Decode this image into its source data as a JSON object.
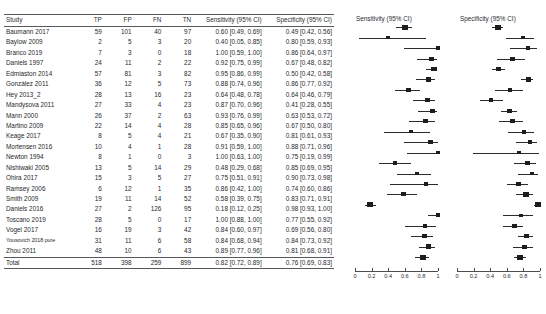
{
  "table": {
    "columns": [
      "Study",
      "TP",
      "FP",
      "FN",
      "TN",
      "Sensitivity (95% CI)",
      "Specificity (95% CI)"
    ],
    "rows": [
      {
        "study": "Baumann 2017",
        "tp": "59",
        "fp": "101",
        "fn": "40",
        "tn": "97",
        "sens": "0.60 [0.49, 0.69]",
        "spec": "0.49 [0.42, 0.56]"
      },
      {
        "study": "Baylow 2009",
        "tp": "2",
        "fp": "5",
        "fn": "3",
        "tn": "20",
        "sens": "0.40 [0.05, 0.85]",
        "spec": "0.80 [0.59, 0.93]"
      },
      {
        "study": "Branco 2019",
        "tp": "7",
        "fp": "3",
        "fn": "0",
        "tn": "18",
        "sens": "1.00 [0.59, 1.00]",
        "spec": "0.86 [0.64, 0.97]"
      },
      {
        "study": "Daniels 1997",
        "tp": "24",
        "fp": "11",
        "fn": "2",
        "tn": "22",
        "sens": "0.92 [0.75, 0.99]",
        "spec": "0.67 [0.48, 0.82]"
      },
      {
        "study": "Edmiaston 2014",
        "tp": "57",
        "fp": "81",
        "fn": "3",
        "tn": "82",
        "sens": "0.95 [0.86, 0.99]",
        "spec": "0.50 [0.42, 0.58]"
      },
      {
        "study": "González 2011",
        "tp": "36",
        "fp": "12",
        "fn": "5",
        "tn": "73",
        "sens": "0.88 [0.74, 0.96]",
        "spec": "0.86 [0.77, 0.92]"
      },
      {
        "study": "Hey 2013_2",
        "tp": "28",
        "fp": "13",
        "fn": "16",
        "tn": "23",
        "sens": "0.64 [0.48, 0.78]",
        "spec": "0.64 [0.46, 0.79]"
      },
      {
        "study": "Mandysova 2011",
        "tp": "27",
        "fp": "33",
        "fn": "4",
        "tn": "23",
        "sens": "0.87 [0.70, 0.96]",
        "spec": "0.41 [0.28, 0.55]"
      },
      {
        "study": "Mann 2000",
        "tp": "26",
        "fp": "37",
        "fn": "2",
        "tn": "63",
        "sens": "0.93 [0.76, 0.99]",
        "spec": "0.63 [0.53, 0.72]"
      },
      {
        "study": "Martino 2009",
        "tp": "22",
        "fp": "14",
        "fn": "4",
        "tn": "28",
        "sens": "0.85 [0.65, 0.96]",
        "spec": "0.67 [0.50, 0.80]"
      },
      {
        "study": "Keage 2017",
        "tp": "8",
        "fp": "5",
        "fn": "4",
        "tn": "21",
        "sens": "0.67 [0.35, 0.90]",
        "spec": "0.81 [0.61, 0.93]"
      },
      {
        "study": "Mortensen 2016",
        "tp": "10",
        "fp": "4",
        "fn": "1",
        "tn": "28",
        "sens": "0.91 [0.59, 1.00]",
        "spec": "0.88 [0.71, 0.96]"
      },
      {
        "study": "Newton 1994",
        "tp": "8",
        "fp": "1",
        "fn": "0",
        "tn": "3",
        "sens": "1.00 [0.63, 1.00]",
        "spec": "0.75 [0.19, 0.99]"
      },
      {
        "study": "Nishiwaki 2005",
        "tp": "13",
        "fp": "5",
        "fn": "14",
        "tn": "29",
        "sens": "0.48 [0.29, 0.68]",
        "spec": "0.85 [0.69, 0.95]"
      },
      {
        "study": "Ohira 2017",
        "tp": "15",
        "fp": "3",
        "fn": "5",
        "tn": "27",
        "sens": "0.75 [0.51, 0.91]",
        "spec": "0.90 [0.73, 0.98]"
      },
      {
        "study": "Ramsey 2006",
        "tp": "6",
        "fp": "12",
        "fn": "1",
        "tn": "35",
        "sens": "0.86 [0.42, 1.00]",
        "spec": "0.74 [0.60, 0.86]"
      },
      {
        "study": "Smith 2009",
        "tp": "19",
        "fp": "11",
        "fn": "14",
        "tn": "52",
        "sens": "0.58 [0.39, 0.75]",
        "spec": "0.83 [0.71, 0.91]"
      },
      {
        "study": "Daniels 2016",
        "tp": "27",
        "fp": "2",
        "fn": "126",
        "tn": "95",
        "sens": "0.18 [0.12, 0.25]",
        "spec": "0.98 [0.93, 1.00]"
      },
      {
        "study": "Toscano 2019",
        "tp": "28",
        "fp": "5",
        "fn": "0",
        "tn": "17",
        "sens": "1.00 [0.88, 1.00]",
        "spec": "0.77 [0.55, 0.92]"
      },
      {
        "study": "Vogel 2017",
        "tp": "16",
        "fp": "19",
        "fn": "3",
        "tn": "42",
        "sens": "0.84 [0.60, 0.97]",
        "spec": "0.69 [0.56, 0.80]"
      },
      {
        "study": "Yousovich 2018 pure",
        "tp": "31",
        "fp": "11",
        "fn": "6",
        "tn": "58",
        "sens": "0.84 [0.68, 0.94]",
        "spec": "0.84 [0.73, 0.92]",
        "small": true
      },
      {
        "study": "Zhou 2011",
        "tp": "48",
        "fp": "10",
        "fn": "6",
        "tn": "43",
        "sens": "0.89 [0.77, 0.96]",
        "spec": "0.81 [0.68, 0.91]"
      },
      {
        "study": "Total",
        "tp": "518",
        "fp": "398",
        "fn": "259",
        "tn": "899",
        "sens": "0.82 [0.72, 0.89]",
        "spec": "0.76 [0.69, 0.83]"
      }
    ]
  },
  "plot": {
    "sensitivity_title": "Sensitivity (95% CI)",
    "specificity_title": "Specificity (95% CI)",
    "tick_labels": [
      "0",
      "0.2",
      "0.4",
      "0.6",
      "0.8",
      "1"
    ],
    "axis_min": 0,
    "axis_max": 1,
    "marker_color": "#1d1d1d"
  },
  "chart_data": {
    "type": "scatter",
    "panels": [
      "Sensitivity (95% CI)",
      "Specificity (95% CI)"
    ],
    "xlabel": "",
    "ylabel": "Study",
    "xlim": [
      0,
      1
    ],
    "xticks": [
      0,
      0.2,
      0.4,
      0.6,
      0.8,
      1
    ],
    "grid": false,
    "legend": "none",
    "categories": [
      "Baumann 2017",
      "Baylow 2009",
      "Branco 2019",
      "Daniels 1997",
      "Edmiaston 2014",
      "González 2011",
      "Hey 2013_2",
      "Mandysova 2011",
      "Mann 2000",
      "Martino 2009",
      "Keage 2017",
      "Mortensen 2016",
      "Newton 1994",
      "Nishiwaki 2005",
      "Ohira 2017",
      "Ramsey 2006",
      "Smith 2009",
      "Daniels 2016",
      "Toscano 2019",
      "Vogel 2017",
      "Yousovich 2018 pure",
      "Zhou 2011",
      "Total"
    ],
    "series": [
      {
        "name": "Sensitivity",
        "estimates": [
          0.6,
          0.4,
          1.0,
          0.92,
          0.95,
          0.88,
          0.64,
          0.87,
          0.93,
          0.85,
          0.67,
          0.91,
          1.0,
          0.48,
          0.75,
          0.86,
          0.58,
          0.18,
          1.0,
          0.84,
          0.84,
          0.89,
          0.82
        ],
        "ci_low": [
          0.49,
          0.05,
          0.59,
          0.75,
          0.86,
          0.74,
          0.48,
          0.7,
          0.76,
          0.65,
          0.35,
          0.59,
          0.63,
          0.29,
          0.51,
          0.42,
          0.39,
          0.12,
          0.88,
          0.6,
          0.68,
          0.77,
          0.72
        ],
        "ci_high": [
          0.69,
          0.85,
          1.0,
          0.99,
          0.99,
          0.96,
          0.78,
          0.96,
          0.99,
          0.96,
          0.9,
          1.0,
          1.0,
          0.68,
          0.91,
          1.0,
          0.75,
          0.25,
          1.0,
          0.97,
          0.94,
          0.96,
          0.89
        ],
        "weights": [
          1.0,
          0.42,
          0.45,
          0.62,
          0.92,
          0.72,
          0.66,
          0.63,
          0.63,
          0.55,
          0.42,
          0.45,
          0.38,
          0.6,
          0.54,
          0.38,
          0.66,
          1.0,
          0.55,
          0.5,
          0.66,
          0.76,
          1.0
        ]
      },
      {
        "name": "Specificity",
        "estimates": [
          0.49,
          0.8,
          0.86,
          0.67,
          0.5,
          0.86,
          0.64,
          0.41,
          0.63,
          0.67,
          0.81,
          0.88,
          0.75,
          0.85,
          0.9,
          0.74,
          0.83,
          0.98,
          0.77,
          0.69,
          0.84,
          0.81,
          0.76
        ],
        "ci_low": [
          0.42,
          0.59,
          0.64,
          0.48,
          0.42,
          0.77,
          0.46,
          0.28,
          0.53,
          0.5,
          0.61,
          0.71,
          0.19,
          0.69,
          0.73,
          0.6,
          0.71,
          0.93,
          0.55,
          0.56,
          0.73,
          0.68,
          0.69
        ],
        "ci_high": [
          0.56,
          0.93,
          0.97,
          0.82,
          0.58,
          0.92,
          0.79,
          0.55,
          0.72,
          0.8,
          0.93,
          0.96,
          0.99,
          0.95,
          0.98,
          0.86,
          0.91,
          1.0,
          0.92,
          0.8,
          0.92,
          0.91,
          0.83
        ],
        "weights": [
          1.0,
          0.42,
          0.45,
          0.6,
          0.95,
          0.78,
          0.55,
          0.62,
          0.8,
          0.58,
          0.48,
          0.5,
          0.3,
          0.62,
          0.52,
          0.7,
          0.8,
          0.92,
          0.45,
          0.7,
          0.72,
          0.68,
          1.0
        ]
      }
    ]
  }
}
